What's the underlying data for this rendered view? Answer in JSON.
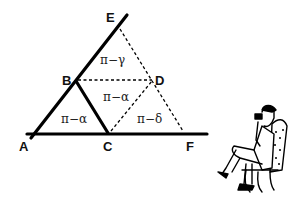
{
  "diagram": {
    "points": {
      "A": {
        "label": "A",
        "x": 27,
        "y": 146
      },
      "B": {
        "label": "B",
        "x": 65,
        "y": 83
      },
      "C": {
        "label": "C",
        "x": 104,
        "y": 150
      },
      "D": {
        "label": "D",
        "x": 156,
        "y": 83
      },
      "E": {
        "label": "E",
        "x": 107,
        "y": 21
      },
      "F": {
        "label": "F",
        "x": 188,
        "y": 150
      }
    },
    "angles": [
      {
        "label": "π−γ",
        "x": 98,
        "y": 62
      },
      {
        "label": "π−α",
        "x": 103,
        "y": 101
      },
      {
        "label": "π−α",
        "x": 61,
        "y": 122
      },
      {
        "label": "π−δ",
        "x": 138,
        "y": 122
      }
    ],
    "colors": {
      "line": "#000000",
      "background": "#ffffff"
    },
    "illustration": "man-seated-in-chair-with-binoculars"
  }
}
